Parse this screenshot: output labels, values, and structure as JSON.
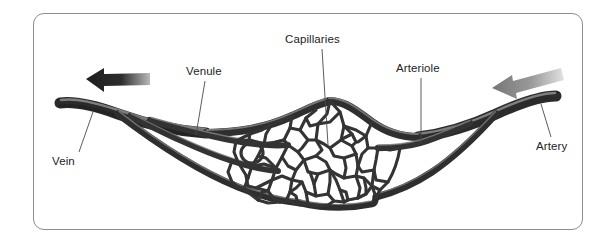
{
  "figure": {
    "background_color": "#ffffff",
    "frame_border_color": "#8e8e8e",
    "vessel_color": "#3a3a3a",
    "vessel_highlight_color": "#9c9c9c",
    "label_text_color": "#232323",
    "leader_line_color": "#4a4a4a"
  },
  "labels": {
    "vein": "Vein",
    "venule": "Venule",
    "capillaries": "Capillaries",
    "arteriole": "Arteriole",
    "artery": "Artery"
  },
  "arrows": [
    {
      "name": "blood-flow-arrow-left",
      "direction": "left",
      "color": "#2b2b2b",
      "position": "upper-left"
    },
    {
      "name": "blood-flow-arrow-right",
      "direction": "left",
      "color": "#8a8a8a",
      "position": "upper-right"
    }
  ],
  "structures": [
    {
      "name": "vein",
      "side": "left",
      "description": "large vessel exiting left"
    },
    {
      "name": "venules",
      "side": "left",
      "description": "branching vessels from vein into capillary bed"
    },
    {
      "name": "capillary-bed",
      "side": "center",
      "description": "dense irregular polygonal mesh network"
    },
    {
      "name": "arterioles",
      "side": "right",
      "description": "branching vessels from artery into capillary bed"
    },
    {
      "name": "artery",
      "side": "right",
      "description": "large vessel entering from right"
    }
  ]
}
